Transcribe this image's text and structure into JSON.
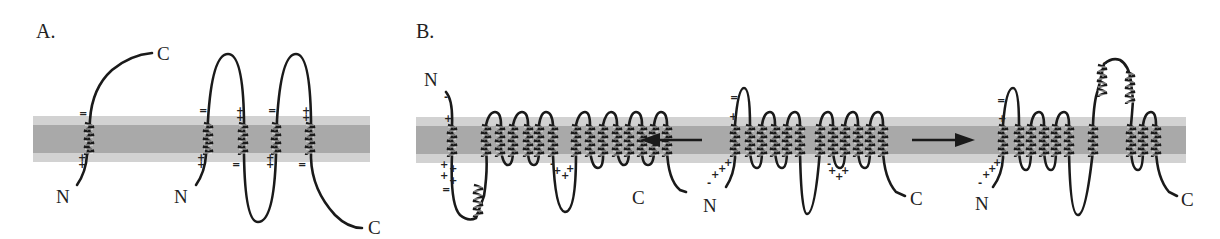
{
  "figure": {
    "panels": [
      {
        "id": "A",
        "label": "A.",
        "proteins": [
          {
            "n_label": "N",
            "c_label": "C",
            "tm_segments": 1,
            "charges": {
              "top": "=",
              "bottom": "++"
            }
          },
          {
            "n_label": "N",
            "c_label": "C",
            "tm_segments": 4,
            "charges": {
              "top": [
                "=",
                "++",
                "=",
                "++"
              ],
              "bottom": [
                "++",
                "=",
                "++",
                "="
              ]
            }
          }
        ]
      },
      {
        "id": "B",
        "label": "B.",
        "proteins": [
          {
            "position": "left",
            "n_label": "N",
            "c_label": "C",
            "tm_segments": 10
          },
          {
            "position": "center",
            "n_label": "N",
            "c_label": "C",
            "tm_segments": 12
          },
          {
            "position": "right",
            "n_label": "N",
            "c_label": "C",
            "tm_segments": 12
          }
        ],
        "arrows": [
          {
            "direction": "left",
            "from": "center",
            "to": "left"
          },
          {
            "direction": "right",
            "from": "center",
            "to": "right"
          }
        ]
      }
    ],
    "colors": {
      "membrane_outer": "#d2d2d2",
      "membrane_inner": "#a9a9a9",
      "chain": "#1a1a1a"
    }
  }
}
